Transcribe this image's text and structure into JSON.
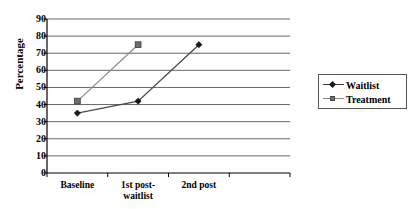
{
  "chart_data": {
    "type": "line",
    "title": "",
    "xlabel": "",
    "ylabel": "Percentage",
    "categories": [
      "Baseline",
      "1st post-\nwaitlist",
      "2nd post"
    ],
    "ytick_labels": [
      "90",
      "80",
      "70",
      "60",
      "50",
      "40",
      "30",
      "20",
      "10",
      "0"
    ],
    "ylim": [
      0,
      90
    ],
    "ytick_step": 10,
    "grid": "horizontal",
    "legend_position": "right",
    "series": [
      {
        "name": "Waitlist",
        "marker": "diamond",
        "color": "#1a1a1a",
        "values": [
          35,
          42,
          75
        ]
      },
      {
        "name": "Treatment",
        "marker": "square",
        "color": "#6e6e6e",
        "values": [
          42,
          75,
          null
        ]
      }
    ]
  },
  "legend": {
    "items": [
      {
        "label": "Waitlist"
      },
      {
        "label": "Treatment"
      }
    ]
  }
}
